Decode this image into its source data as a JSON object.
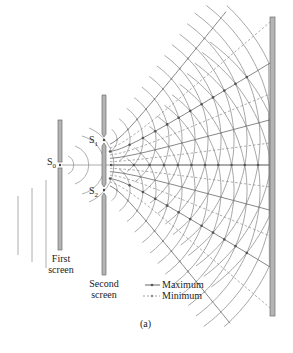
{
  "figure": {
    "caption": "(a)",
    "labels": {
      "s0": "S",
      "s0_sub": "0",
      "s1": "S",
      "s1_sub": "1",
      "s2": "S",
      "s2_sub": "2",
      "first_screen_line1": "First",
      "first_screen_line2": "screen",
      "second_screen_line1": "Second",
      "second_screen_line2": "screen"
    },
    "legend": {
      "maximum": "Maximum",
      "minimum": "Minimum"
    },
    "colors": {
      "wave": "#8a8a8a",
      "screen_fill": "#b4b4b4",
      "screen_stroke": "#6e6e6e",
      "dots": "#555555",
      "text": "#222222"
    }
  }
}
